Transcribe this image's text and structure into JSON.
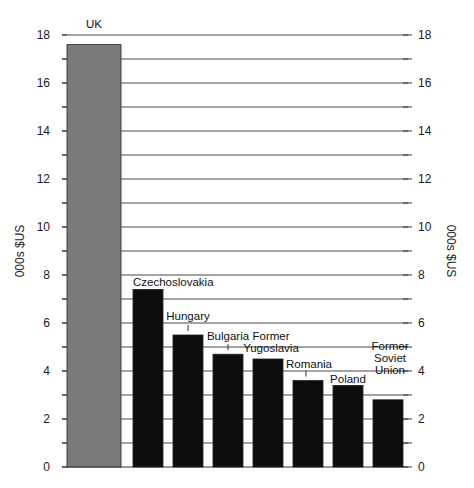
{
  "chart_data": {
    "type": "bar",
    "title": "",
    "xlabel": "",
    "ylabel": "000s $US",
    "ylabel_right": "000s $US",
    "ylim": [
      0,
      18
    ],
    "yticks": [
      0,
      2,
      4,
      6,
      8,
      10,
      12,
      14,
      16,
      18
    ],
    "grid": true,
    "legend": null,
    "categories": [
      "UK",
      "Czechoslovakia",
      "Hungary",
      "Bulgaria",
      "Former Yugoslavia",
      "Romania",
      "Poland",
      "Former Soviet Union"
    ],
    "values": [
      17.6,
      7.4,
      5.5,
      4.7,
      4.5,
      3.6,
      3.4,
      2.8
    ],
    "bar_colors": [
      "#7a7a7a",
      "#0d0d0d",
      "#0d0d0d",
      "#0d0d0d",
      "#0d0d0d",
      "#0d0d0d",
      "#0d0d0d",
      "#0d0d0d"
    ],
    "label_lines": [
      [
        "UK"
      ],
      [
        "Czechoslovakia"
      ],
      [
        "Hungary"
      ],
      [
        "Bulgaria"
      ],
      [
        "Former",
        "Yugoslavia"
      ],
      [
        "Romania"
      ],
      [
        "Poland"
      ],
      [
        "Former",
        "Soviet",
        "Union"
      ]
    ]
  }
}
